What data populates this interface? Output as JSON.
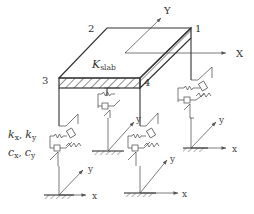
{
  "diagram": {
    "slab_label": {
      "main": "K",
      "sub": "slab"
    },
    "corner_labels": [
      "1",
      "2",
      "3",
      "4"
    ],
    "global_axes": {
      "x": "X",
      "y": "Y"
    },
    "local_axes": {
      "x": "x",
      "y": "y"
    },
    "isolator_labels": {
      "stiffness": {
        "k1": "k",
        "s1": "x",
        "sep": ", ",
        "k2": "k",
        "s2": "y"
      },
      "damping": {
        "c1": "c",
        "s1": "x",
        "sep": ", ",
        "c2": "c",
        "s2": "y"
      }
    },
    "colors": {
      "line": "#333333",
      "background": "#ffffff"
    }
  }
}
